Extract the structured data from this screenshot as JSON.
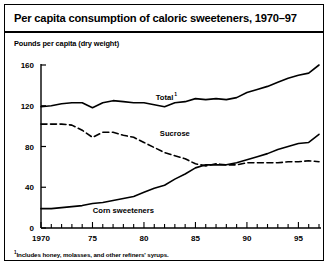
{
  "figure": {
    "title": "Per capita consumption of caloric sweeteners, 1970–97",
    "axis_title": "Pounds per capita (dry weight)",
    "footnote_marker": "1",
    "footnote_text": "Includes honey, molasses, and other refiners' syrups.",
    "line_color": "#000000",
    "background": "#ffffff"
  },
  "chart_data": {
    "type": "line",
    "title": "Per capita consumption of caloric sweeteners, 1970–97",
    "xlabel": "",
    "ylabel": "Pounds per capita (dry weight)",
    "xlim": [
      1970,
      1997
    ],
    "ylim": [
      0,
      160
    ],
    "yticks": [
      0,
      40,
      80,
      120,
      160
    ],
    "ytick_labels": [
      "0",
      "40",
      "80",
      "120",
      "160"
    ],
    "xticks": [
      1970,
      1975,
      1980,
      1985,
      1990,
      1995
    ],
    "xtick_labels": [
      "1970",
      "75",
      "80",
      "85",
      "90",
      "95"
    ],
    "minor_xticks_every": 1,
    "grid": false,
    "legend": "inline-labels",
    "x": [
      1970,
      1971,
      1972,
      1973,
      1974,
      1975,
      1976,
      1977,
      1978,
      1979,
      1980,
      1981,
      1982,
      1983,
      1984,
      1985,
      1986,
      1987,
      1988,
      1989,
      1990,
      1991,
      1992,
      1993,
      1994,
      1995,
      1996,
      1997
    ],
    "series": [
      {
        "name": "Total",
        "label": "Total",
        "label_superscript": "1",
        "style": "solid",
        "label_x": 1982,
        "label_y": 126,
        "values": [
          119,
          120,
          122,
          123,
          123,
          118,
          123,
          125,
          124,
          123,
          123,
          121,
          119,
          123,
          124,
          127,
          126,
          127,
          126,
          128,
          133,
          136,
          139,
          143,
          147,
          150,
          152,
          160
        ]
      },
      {
        "name": "Sucrose",
        "label": "Sucrose",
        "style": "dashed",
        "label_x": 1983,
        "label_y": 90,
        "values": [
          102,
          102,
          102,
          101,
          96,
          89,
          94,
          94,
          91,
          89,
          84,
          79,
          74,
          71,
          68,
          63,
          61,
          63,
          62,
          62,
          64,
          64,
          64,
          64,
          65,
          65,
          66,
          65
        ]
      },
      {
        "name": "Corn sweeteners",
        "label": "Corn sweeteners",
        "style": "solid",
        "label_x": 1978,
        "label_y": 15,
        "values": [
          19,
          19,
          20,
          21,
          22,
          24,
          25,
          27,
          29,
          31,
          35,
          39,
          42,
          48,
          53,
          59,
          62,
          62,
          62,
          64,
          67,
          70,
          73,
          77,
          80,
          83,
          84,
          92
        ]
      }
    ]
  }
}
